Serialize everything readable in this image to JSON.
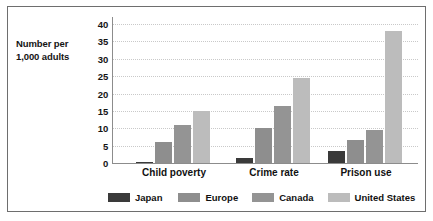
{
  "chart_data": {
    "type": "bar",
    "title": "",
    "subtitle": "",
    "xlabel": "",
    "ylabel": "Number per 1,000 adults",
    "ylabel_lines": [
      "Number per",
      "1,000 adults"
    ],
    "categories": [
      "Child poverty",
      "Crime rate",
      "Prison use"
    ],
    "series": [
      {
        "name": "Japan",
        "color": "#3a3a3a",
        "values": [
          0.3,
          1.5,
          3.5
        ]
      },
      {
        "name": "Europe",
        "color": "#8e8e8e",
        "values": [
          6,
          10,
          6.5
        ]
      },
      {
        "name": "Canada",
        "color": "#949494",
        "values": [
          11,
          16.5,
          9.5
        ]
      },
      {
        "name": "United States",
        "color": "#bcbcbc",
        "values": [
          15,
          24.5,
          38
        ]
      }
    ],
    "ylim": [
      0,
      40
    ],
    "yticks": [
      0,
      5,
      10,
      15,
      20,
      25,
      30,
      35,
      40
    ],
    "ytick_labels": [
      "0",
      "5",
      "10",
      "15",
      "20",
      "25",
      "30",
      "35",
      "40"
    ],
    "grid": true,
    "grid_axis": "y",
    "grid_style": "dotted",
    "grid_color": "#c9c9c9",
    "legend_position": "bottom",
    "axis_color": "#8c8c8c",
    "background_color": "#ffffff",
    "border_color": "#6e6e6e"
  }
}
